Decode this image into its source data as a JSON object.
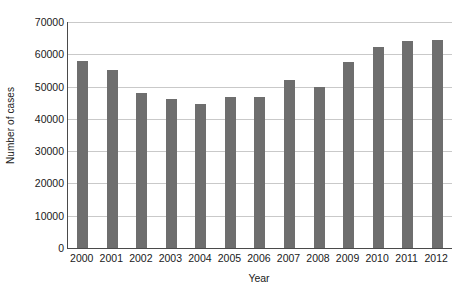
{
  "chart_data": {
    "type": "bar",
    "title": "",
    "xlabel": "Year",
    "ylabel": "Number of cases",
    "categories": [
      "2000",
      "2001",
      "2002",
      "2003",
      "2004",
      "2005",
      "2006",
      "2007",
      "2008",
      "2009",
      "2010",
      "2011",
      "2012"
    ],
    "values": [
      58000,
      55000,
      48000,
      46200,
      44500,
      46800,
      46800,
      52000,
      49800,
      57500,
      62300,
      64200,
      64500
    ],
    "ylim": [
      0,
      70000
    ],
    "yticks": [
      0,
      10000,
      20000,
      30000,
      40000,
      50000,
      60000,
      70000
    ],
    "ytick_labels": [
      "0",
      "10000",
      "20000",
      "30000",
      "40000",
      "50000",
      "60000",
      "70000"
    ],
    "grid": true,
    "grid_axis": "y",
    "legend": false,
    "legend_position": "none",
    "bar_color": "#6e6e6e",
    "grid_color": "#c9c9c9",
    "axis_color": "#4a4a4a",
    "background_color": "#ffffff"
  }
}
